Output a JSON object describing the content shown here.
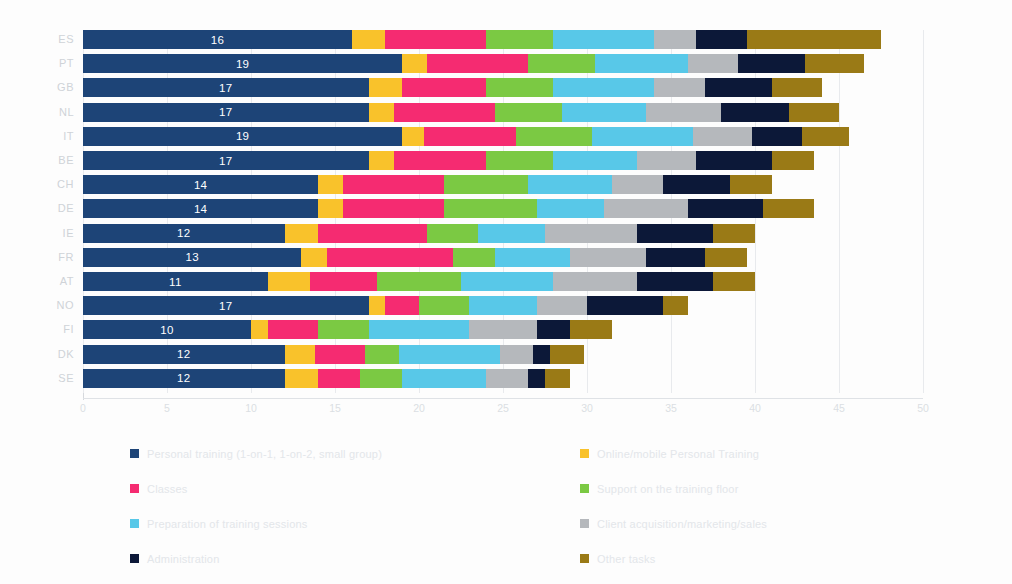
{
  "chart_data": {
    "type": "bar",
    "orientation": "horizontal",
    "stacked": true,
    "title": "",
    "subtitle": "",
    "xlabel": "",
    "ylabel": "",
    "xlim": [
      0,
      50
    ],
    "xticks": [
      "0",
      "5",
      "10",
      "15",
      "20",
      "25",
      "30",
      "35",
      "40",
      "45",
      "50"
    ],
    "grid": true,
    "legend_position": "bottom",
    "categories": [
      "ES",
      "PT",
      "GB",
      "NL",
      "IT",
      "BE",
      "CH",
      "DE",
      "IE",
      "FR",
      "AT",
      "NO",
      "FI",
      "DK",
      "SE"
    ],
    "series": [
      {
        "name": "Personal training (1-on-1, 1-on-2, small group)",
        "color": "#1D4477",
        "values": [
          16,
          19,
          17,
          17,
          19,
          17,
          14,
          14,
          12,
          13,
          11,
          17,
          10,
          12,
          12
        ]
      },
      {
        "name": "Online/mobile Personal Training",
        "color": "#F9C22B",
        "values": [
          2,
          1.5,
          2,
          1.5,
          1.3,
          1.5,
          1.5,
          1.5,
          2,
          1.5,
          2.5,
          1,
          1,
          1.8,
          2
        ]
      },
      {
        "name": "Classes",
        "color": "#F52B71",
        "values": [
          6,
          6,
          5,
          6,
          5.5,
          5.5,
          6,
          6,
          6.5,
          7.5,
          4,
          2,
          3,
          3,
          2.5
        ]
      },
      {
        "name": "Support on the training floor",
        "color": "#7BC943",
        "values": [
          4,
          4,
          4,
          4,
          4.5,
          4,
          5,
          5.5,
          3,
          2.5,
          5,
          3,
          3,
          2,
          2.5
        ]
      },
      {
        "name": "Preparation of training sessions",
        "color": "#58C8E8",
        "values": [
          6,
          5.5,
          6,
          5,
          6,
          5,
          5,
          4,
          4,
          4.5,
          5.5,
          4,
          6,
          6,
          5
        ]
      },
      {
        "name": "Client acquisition/marketing/sales",
        "color": "#B5B8BC",
        "values": [
          2.5,
          3,
          3,
          4.5,
          3.5,
          3.5,
          3,
          5,
          5.5,
          4.5,
          5,
          3,
          4,
          2,
          2.5
        ]
      },
      {
        "name": "Administration",
        "color": "#0C1838",
        "values": [
          3,
          4,
          4,
          4,
          3,
          4.5,
          4,
          4.5,
          4.5,
          3.5,
          4.5,
          4.5,
          2,
          1,
          1
        ]
      },
      {
        "name": "Other tasks",
        "color": "#9A7A16",
        "values": [
          8,
          3.5,
          3,
          3,
          2.8,
          2.5,
          2.5,
          3,
          2.5,
          2.5,
          2.5,
          1.5,
          2.5,
          2,
          1.5
        ]
      }
    ]
  },
  "axis": {
    "x_ticks": [
      "0",
      "5",
      "10",
      "15",
      "20",
      "25",
      "30",
      "35",
      "40",
      "45",
      "50"
    ],
    "y_labels": [
      "ES",
      "PT",
      "GB",
      "NL",
      "IT",
      "BE",
      "CH",
      "DE",
      "IE",
      "FR",
      "AT",
      "NO",
      "FI",
      "DK",
      "SE"
    ]
  },
  "bar_labels": [
    "16",
    "19",
    "17",
    "17",
    "19",
    "17",
    "14",
    "14",
    "12",
    "13",
    "11",
    "17",
    "10",
    "12",
    "12"
  ],
  "legend": {
    "left_column": [
      {
        "label": "Personal training (1-on-1, 1-on-2, small group)",
        "color": "#1D4477"
      },
      {
        "label": "Classes",
        "color": "#F52B71"
      },
      {
        "label": "Preparation of training sessions",
        "color": "#58C8E8"
      },
      {
        "label": "Administration",
        "color": "#0C1838"
      }
    ],
    "right_column": [
      {
        "label": "Online/mobile Personal Training",
        "color": "#F9C22B"
      },
      {
        "label": "Support on the training floor",
        "color": "#7BC943"
      },
      {
        "label": "Client acquisition/marketing/sales",
        "color": "#B5B8BC"
      },
      {
        "label": "Other tasks",
        "color": "#9A7A16"
      }
    ]
  },
  "colors": {
    "background": "#fdfdfd",
    "grid": "#e8eaed",
    "axis_text": "#dbdfe3",
    "bar_value_text": "#ffffff"
  }
}
